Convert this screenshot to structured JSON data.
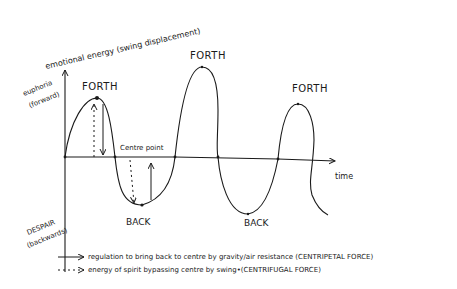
{
  "diagram": {
    "y_axis": {
      "title": "emotional energy (swing displacement)",
      "top_label_line1": "euphoria",
      "top_label_line2": "(forward)",
      "bottom_label_line1": "DESPAIR",
      "bottom_label_line2": "(backwards)"
    },
    "x_axis": {
      "label": "time"
    },
    "centre_label": "Centre point",
    "peaks": [
      {
        "label": "FORTH"
      },
      {
        "label": "FORTH"
      },
      {
        "label": "FORTH"
      }
    ],
    "troughs": [
      {
        "label": "BACK"
      },
      {
        "label": "BACK"
      }
    ],
    "legend": [
      {
        "style": "solid-arrow",
        "text": "regulation to bring back to centre by gravity/air resistance (CENTRIPETAL FORCE)"
      },
      {
        "style": "dashed-arrow",
        "text": "energy of spirit bypassing centre by swing•(CENTRIFUGAL FORCE)"
      }
    ],
    "line_color": "#1a1a1a",
    "background": "#ffffff"
  }
}
